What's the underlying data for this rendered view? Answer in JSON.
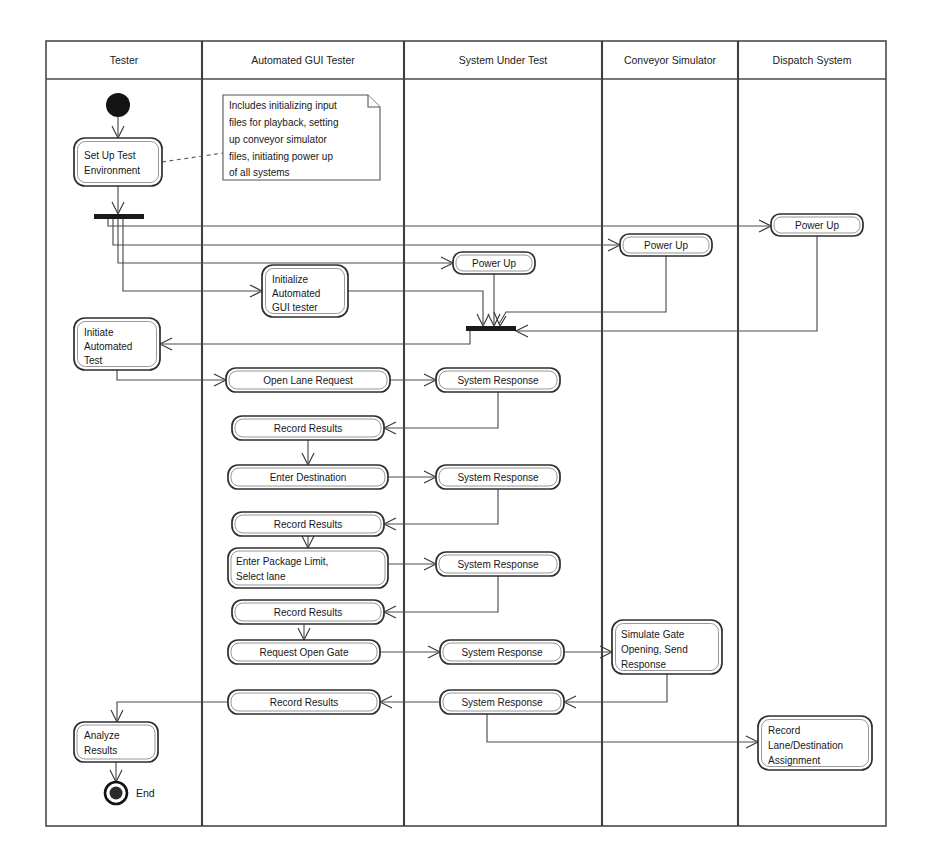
{
  "diagram": {
    "type": "uml-activity-swimlane",
    "canvas": {
      "width": 930,
      "height": 861
    }
  },
  "lanes": [
    {
      "id": "tester",
      "label": "Tester",
      "x": 46,
      "width": 156
    },
    {
      "id": "automated-gui-tester",
      "label": "Automated GUI Tester",
      "x": 202,
      "width": 202
    },
    {
      "id": "system-under-test",
      "label": "System Under Test",
      "x": 404,
      "width": 198
    },
    {
      "id": "conveyor-simulator",
      "label": "Conveyor Simulator",
      "x": 602,
      "width": 136
    },
    {
      "id": "dispatch-system",
      "label": "Dispatch System",
      "x": 738,
      "width": 148
    }
  ],
  "frame": {
    "x": 46,
    "y": 41,
    "width": 840,
    "height": 785,
    "header_height": 38
  },
  "nodes": [
    {
      "id": "start",
      "kind": "initial-node",
      "lane": "tester",
      "cx": 118,
      "cy": 105,
      "r": 12
    },
    {
      "id": "set-up-test-environment",
      "kind": "action",
      "lane": "tester",
      "label": [
        "Set Up Test",
        "Environment"
      ],
      "x": 74,
      "y": 138,
      "w": 88,
      "h": 48,
      "align": "left"
    },
    {
      "id": "note-setup",
      "kind": "note",
      "lane": "automated-gui-tester",
      "label": [
        "Includes initializing input",
        "files for playback, setting",
        "up conveyor simulator",
        "files, initiating power up",
        "of all systems"
      ],
      "x": 223,
      "y": 95,
      "w": 157,
      "h": 85
    },
    {
      "id": "fork-bar",
      "kind": "fork",
      "lane": "tester",
      "x": 94,
      "y": 214,
      "w": 50,
      "h": 5
    },
    {
      "id": "power-up-dispatch",
      "kind": "action",
      "lane": "dispatch-system",
      "label": [
        "Power Up"
      ],
      "x": 771,
      "y": 214,
      "w": 92,
      "h": 22,
      "align": "center"
    },
    {
      "id": "power-up-conveyor",
      "kind": "action",
      "lane": "conveyor-simulator",
      "label": [
        "Power Up"
      ],
      "x": 620,
      "y": 234,
      "w": 92,
      "h": 22,
      "align": "center"
    },
    {
      "id": "power-up-sut",
      "kind": "action",
      "lane": "system-under-test",
      "label": [
        "Power Up"
      ],
      "x": 453,
      "y": 252,
      "w": 82,
      "h": 22,
      "align": "center"
    },
    {
      "id": "initialize-automated-gui-tester",
      "kind": "action",
      "lane": "automated-gui-tester",
      "label": [
        "Initialize",
        "Automated",
        "GUI tester"
      ],
      "x": 262,
      "y": 265,
      "w": 86,
      "h": 52,
      "align": "left"
    },
    {
      "id": "join-bar",
      "kind": "join",
      "lane": "system-under-test",
      "x": 466,
      "y": 326,
      "w": 50,
      "h": 5
    },
    {
      "id": "initiate-automated-test",
      "kind": "action",
      "lane": "tester",
      "label": [
        "Initiate",
        "Automated",
        "Test"
      ],
      "x": 74,
      "y": 318,
      "w": 86,
      "h": 52,
      "align": "left"
    },
    {
      "id": "open-lane-request",
      "kind": "action",
      "lane": "automated-gui-tester",
      "label": [
        "Open Lane Request"
      ],
      "x": 226,
      "y": 368,
      "w": 164,
      "h": 24,
      "align": "center"
    },
    {
      "id": "system-response-1",
      "kind": "action",
      "lane": "system-under-test",
      "label": [
        "System Response"
      ],
      "x": 436,
      "y": 368,
      "w": 124,
      "h": 24,
      "align": "center"
    },
    {
      "id": "record-results-1",
      "kind": "action",
      "lane": "automated-gui-tester",
      "label": [
        "Record Results"
      ],
      "x": 232,
      "y": 416,
      "w": 152,
      "h": 24,
      "align": "center"
    },
    {
      "id": "enter-destination",
      "kind": "action",
      "lane": "automated-gui-tester",
      "label": [
        "Enter Destination"
      ],
      "x": 228,
      "y": 465,
      "w": 160,
      "h": 24,
      "align": "center"
    },
    {
      "id": "system-response-2",
      "kind": "action",
      "lane": "system-under-test",
      "label": [
        "System Response"
      ],
      "x": 436,
      "y": 465,
      "w": 124,
      "h": 24,
      "align": "center"
    },
    {
      "id": "record-results-2",
      "kind": "action",
      "lane": "automated-gui-tester",
      "label": [
        "Record Results"
      ],
      "x": 232,
      "y": 512,
      "w": 152,
      "h": 24,
      "align": "center"
    },
    {
      "id": "enter-package-limit",
      "kind": "action",
      "lane": "automated-gui-tester",
      "label": [
        "Enter Package Limit,",
        "Select lane"
      ],
      "x": 228,
      "y": 548,
      "w": 160,
      "h": 40,
      "align": "left"
    },
    {
      "id": "system-response-3",
      "kind": "action",
      "lane": "system-under-test",
      "label": [
        "System Response"
      ],
      "x": 436,
      "y": 552,
      "w": 124,
      "h": 24,
      "align": "center"
    },
    {
      "id": "record-results-3",
      "kind": "action",
      "lane": "automated-gui-tester",
      "label": [
        "Record Results"
      ],
      "x": 232,
      "y": 600,
      "w": 152,
      "h": 24,
      "align": "center"
    },
    {
      "id": "request-open-gate",
      "kind": "action",
      "lane": "automated-gui-tester",
      "label": [
        "Request Open Gate"
      ],
      "x": 228,
      "y": 640,
      "w": 152,
      "h": 24,
      "align": "center"
    },
    {
      "id": "system-response-4",
      "kind": "action",
      "lane": "system-under-test",
      "label": [
        "System Response"
      ],
      "x": 440,
      "y": 640,
      "w": 124,
      "h": 24,
      "align": "center"
    },
    {
      "id": "simulate-gate-opening",
      "kind": "action",
      "lane": "conveyor-simulator",
      "label": [
        "Simulate Gate",
        "Opening, Send",
        "Response"
      ],
      "x": 612,
      "y": 620,
      "w": 110,
      "h": 54,
      "align": "left"
    },
    {
      "id": "record-results-4",
      "kind": "action",
      "lane": "automated-gui-tester",
      "label": [
        "Record Results"
      ],
      "x": 228,
      "y": 690,
      "w": 152,
      "h": 24,
      "align": "center"
    },
    {
      "id": "system-response-5",
      "kind": "action",
      "lane": "system-under-test",
      "label": [
        "System Response"
      ],
      "x": 440,
      "y": 690,
      "w": 124,
      "h": 24,
      "align": "center"
    },
    {
      "id": "record-lane-destination",
      "kind": "action",
      "lane": "dispatch-system",
      "label": [
        "Record",
        "Lane/Destination",
        "Assignment"
      ],
      "x": 758,
      "y": 716,
      "w": 114,
      "h": 54,
      "align": "left"
    },
    {
      "id": "analyze-results",
      "kind": "action",
      "lane": "tester",
      "label": [
        "Analyze",
        "Results"
      ],
      "x": 74,
      "y": 722,
      "w": 84,
      "h": 40,
      "align": "left"
    },
    {
      "id": "end",
      "kind": "final-node",
      "lane": "tester",
      "cx": 116,
      "cy": 793,
      "r": 11,
      "label": "End",
      "label_x": 136,
      "label_y": 797
    }
  ],
  "edges": [
    {
      "id": "start-to-setup",
      "from": "start",
      "to": "set-up-test-environment",
      "style": "solid"
    },
    {
      "id": "setup-to-note",
      "from": "set-up-test-environment",
      "to": "note-setup",
      "style": "dashed"
    },
    {
      "id": "setup-to-fork",
      "from": "set-up-test-environment",
      "to": "fork-bar",
      "style": "solid"
    },
    {
      "id": "fork-to-power-up-dispatch",
      "from": "fork-bar",
      "to": "power-up-dispatch",
      "style": "solid"
    },
    {
      "id": "fork-to-power-up-conveyor",
      "from": "fork-bar",
      "to": "power-up-conveyor",
      "style": "solid"
    },
    {
      "id": "fork-to-power-up-sut",
      "from": "fork-bar",
      "to": "power-up-sut",
      "style": "solid"
    },
    {
      "id": "fork-to-initialize-gui",
      "from": "fork-bar",
      "to": "initialize-automated-gui-tester",
      "style": "solid"
    },
    {
      "id": "power-up-sut-to-join",
      "from": "power-up-sut",
      "to": "join-bar",
      "style": "solid"
    },
    {
      "id": "power-up-conveyor-to-join",
      "from": "power-up-conveyor",
      "to": "join-bar",
      "style": "solid"
    },
    {
      "id": "power-up-dispatch-to-join",
      "from": "power-up-dispatch",
      "to": "join-bar",
      "style": "solid"
    },
    {
      "id": "initialize-gui-to-join",
      "from": "initialize-automated-gui-tester",
      "to": "join-bar",
      "style": "solid"
    },
    {
      "id": "join-to-initiate-test",
      "from": "join-bar",
      "to": "initiate-automated-test",
      "style": "solid"
    },
    {
      "id": "initiate-to-open-lane",
      "from": "initiate-automated-test",
      "to": "open-lane-request",
      "style": "solid"
    },
    {
      "id": "open-lane-to-response1",
      "from": "open-lane-request",
      "to": "system-response-1",
      "style": "solid"
    },
    {
      "id": "response1-to-record1",
      "from": "system-response-1",
      "to": "record-results-1",
      "style": "solid"
    },
    {
      "id": "record1-to-enter-destination",
      "from": "record-results-1",
      "to": "enter-destination",
      "style": "solid"
    },
    {
      "id": "enter-destination-to-response2",
      "from": "enter-destination",
      "to": "system-response-2",
      "style": "solid"
    },
    {
      "id": "response2-to-record2",
      "from": "system-response-2",
      "to": "record-results-2",
      "style": "solid"
    },
    {
      "id": "record2-to-package-limit",
      "from": "record-results-2",
      "to": "enter-package-limit",
      "style": "solid"
    },
    {
      "id": "package-limit-to-response3",
      "from": "enter-package-limit",
      "to": "system-response-3",
      "style": "solid"
    },
    {
      "id": "response3-to-record3",
      "from": "system-response-3",
      "to": "record-results-3",
      "style": "solid"
    },
    {
      "id": "record3-to-request-gate",
      "from": "record-results-3",
      "to": "request-open-gate",
      "style": "solid"
    },
    {
      "id": "request-gate-to-response4",
      "from": "request-open-gate",
      "to": "system-response-4",
      "style": "solid"
    },
    {
      "id": "response4-to-simulate-gate",
      "from": "system-response-4",
      "to": "simulate-gate-opening",
      "style": "solid"
    },
    {
      "id": "simulate-gate-to-response5",
      "from": "simulate-gate-opening",
      "to": "system-response-5",
      "style": "solid"
    },
    {
      "id": "response5-to-record4",
      "from": "system-response-5",
      "to": "record-results-4",
      "style": "solid"
    },
    {
      "id": "response5-to-record-lane",
      "from": "system-response-5",
      "to": "record-lane-destination",
      "style": "solid"
    },
    {
      "id": "record4-to-analyze",
      "from": "record-results-4",
      "to": "analyze-results",
      "style": "solid"
    },
    {
      "id": "analyze-to-end",
      "from": "analyze-results",
      "to": "end",
      "style": "solid"
    }
  ],
  "colors": {
    "background": "#ffffff",
    "frame_stroke": "#4a4a4a",
    "lane_divider": "#3f3f3f",
    "node_stroke": "#2e2e2e",
    "node_fill": "#ffffff",
    "flow_stroke": "#4d4d4d",
    "text": "#17171a",
    "bar_fill": "#1a1a1a"
  }
}
